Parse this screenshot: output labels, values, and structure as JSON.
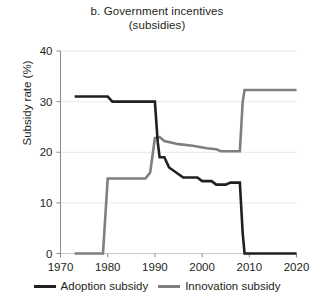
{
  "chart_data": {
    "type": "line",
    "title": "b. Government incentives",
    "subtitle": "(subsidies)",
    "xlabel": "",
    "ylabel": "Subsidy rate (%)",
    "xlim": [
      1970,
      2020
    ],
    "ylim": [
      0,
      40
    ],
    "xticks": [
      1970,
      1980,
      1990,
      2000,
      2010,
      2020
    ],
    "yticks": [
      0,
      10,
      20,
      30,
      40
    ],
    "grid": true,
    "grid_axis": "y",
    "legend_position": "bottom",
    "series": [
      {
        "name": "Adoption subsidy",
        "color": "#231f20",
        "x": [
          1973,
          1980,
          1981,
          1985,
          1986,
          1990,
          1990.6,
          1991,
          1992,
          1993,
          1996,
          1999,
          2000,
          2002,
          2003,
          2005,
          2006,
          2007,
          2008,
          2008.6,
          2009,
          2020
        ],
        "y": [
          31,
          31,
          30,
          30,
          30,
          30,
          22,
          19,
          19,
          17,
          15,
          15,
          14.3,
          14.3,
          13.6,
          13.6,
          14,
          14,
          14,
          4,
          0,
          0
        ]
      },
      {
        "name": "Innovation subsidy",
        "color": "#7f7f7f",
        "x": [
          1973,
          1979,
          1980,
          1982,
          1988,
          1989,
          1990,
          1991,
          1992,
          1995,
          1998,
          2001,
          2003,
          2004,
          2006,
          2007,
          2008,
          2008.6,
          2009,
          2020
        ],
        "y": [
          0,
          0,
          14.8,
          14.8,
          14.8,
          16,
          22.8,
          23,
          22.2,
          21.6,
          21.3,
          20.8,
          20.6,
          20.2,
          20.2,
          20.2,
          20.2,
          30,
          32.3,
          32.3
        ]
      }
    ]
  },
  "legend": {
    "items": [
      {
        "label": "Adoption subsidy",
        "color": "#231f20"
      },
      {
        "label": "Innovation subsidy",
        "color": "#7f7f7f"
      }
    ]
  }
}
